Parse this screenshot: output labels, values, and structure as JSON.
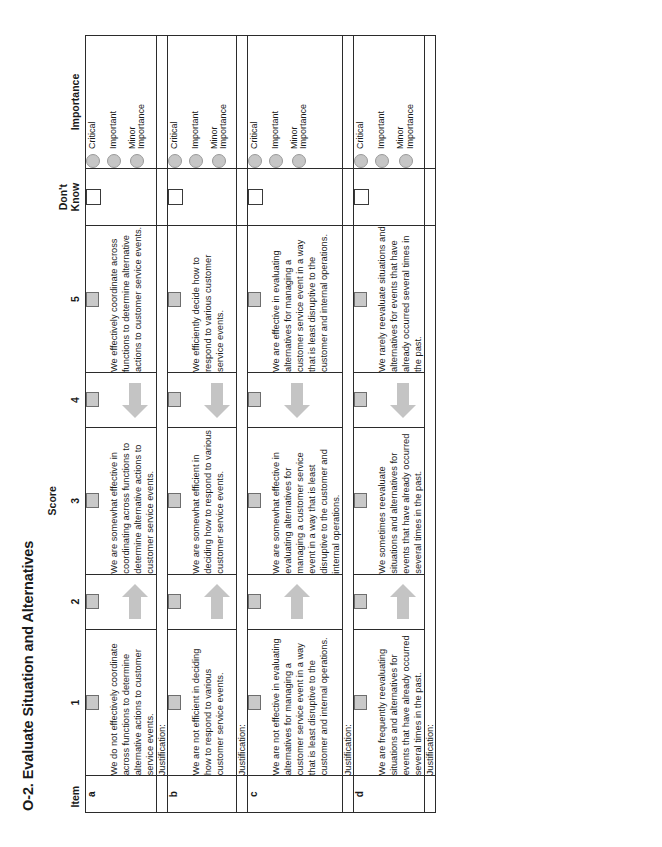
{
  "title": "O-2. Evaluate Situation and Alternatives",
  "header": {
    "item": "Item",
    "score_group": "Score",
    "score_cols": [
      "1",
      "2",
      "3",
      "4",
      "5"
    ],
    "dont_know": "Don't\nKnow",
    "importance": "Importance"
  },
  "importance_options": [
    {
      "label": "Critical"
    },
    {
      "label": "Important"
    },
    {
      "label": "Minor\nImportance"
    }
  ],
  "justification_label": "Justification:",
  "rows": [
    {
      "id": "a",
      "score1": "We do not effectively coordinate across functions to determine alternative actions to customer service events.",
      "score3": "We are somewhat effective in coordinating across functions to determine alternative actions to customer service events.",
      "score5": "We effectively coordinate across functions to determine alternative actions to customer service events."
    },
    {
      "id": "b",
      "score1": "We are not efficient in deciding how to respond to various customer service events.",
      "score3": "We are somewhat efficient in deciding how to respond to various customer service events.",
      "score5": "We efficiently decide how to respond to various customer service events."
    },
    {
      "id": "c",
      "score1": "We are not effective in evaluating alternatives for managing a customer service event in a way that is least disruptive to the customer and internal operations.",
      "score3": "We are somewhat effective in evaluating alternatives for managing a customer service event in a way that is least disruptive to the customer and internal operations.",
      "score5": "We are effective in evaluating alternatives for managing a customer service event in a way that is least disruptive to the customer and internal operations."
    },
    {
      "id": "d",
      "score1": "We are frequently reevaluating situations and alternatives for events that have already occurred several times in the past.",
      "score3": "We sometimes reevaluate situations and alternatives for events that have already occurred several times in the past.",
      "score5": "We rarely reevaluate situations and alternatives for events that have already occurred several times in the past."
    }
  ],
  "colors": {
    "checkbox_fill": "#c9c9c9",
    "arrow_fill": "#c4c4c4",
    "dot_fill": "#c6c6c6",
    "border": "#2b2b2b"
  }
}
